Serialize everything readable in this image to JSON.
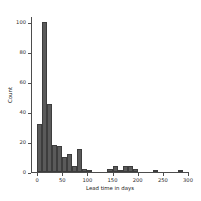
{
  "chart_data": {
    "type": "bar",
    "title": "",
    "xlabel": "Lead time in days",
    "ylabel": "Count",
    "xlim": [
      -12,
      302
    ],
    "ylim": [
      0,
      103
    ],
    "grid": false,
    "legend": null,
    "bin_width": 10,
    "xticks": [
      0,
      50,
      100,
      150,
      200,
      250,
      300
    ],
    "xtick_labels": [
      "0",
      "50",
      "100",
      "150",
      "200",
      "250",
      "300"
    ],
    "yticks": [
      0,
      20,
      40,
      60,
      80,
      100
    ],
    "ytick_labels": [
      "0",
      "20",
      "40",
      "60",
      "80",
      "100"
    ],
    "bar_color": "#5a5a5a",
    "bar_edge_color": "#3d3d3d",
    "axis_color": "#4d4d4d",
    "categories": [
      0,
      10,
      20,
      30,
      40,
      50,
      60,
      70,
      80,
      90,
      100,
      110,
      120,
      130,
      140,
      150,
      160,
      170,
      180,
      190,
      200,
      210,
      220,
      230,
      240,
      250,
      260,
      270,
      280,
      290
    ],
    "values": [
      32,
      100,
      45,
      18,
      17,
      10,
      12,
      4,
      15,
      2,
      1,
      0,
      0,
      0,
      2,
      4,
      1,
      4,
      4,
      2,
      0,
      0,
      0,
      1,
      0,
      0,
      0,
      0,
      1,
      0
    ]
  }
}
